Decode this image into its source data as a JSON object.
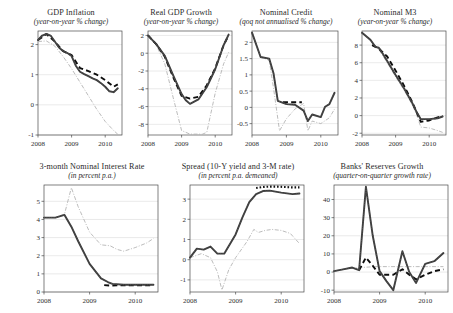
{
  "figure": {
    "background": "#ffffff",
    "series_styles": {
      "actual": "#3b3b3b",
      "forecast_dashed": "#0d0d0d",
      "counterfactual_light": "#b0b0b0",
      "dotted": "#111111"
    }
  },
  "chart_data": [
    {
      "type": "line",
      "id": "gdp-inflation",
      "title": "GDP Inflation",
      "subtitle": "(year-on-year % change)",
      "xlabel": "",
      "ylabel": "",
      "xlim": [
        2008.0,
        2010.5
      ],
      "ylim": [
        -1,
        2.45
      ],
      "xticks": [
        2008,
        2009,
        2010
      ],
      "xticklabels": [
        "2008",
        "2009",
        "2010"
      ],
      "yticks": [
        -1,
        0,
        1,
        2
      ],
      "yticklabels": [
        "-1",
        "0",
        "1",
        "2"
      ],
      "grid": true,
      "legend": "none",
      "series": [
        {
          "name": "actual",
          "style": "solid-thick-grey",
          "x": [
            2008.0,
            2008.125,
            2008.25,
            2008.375,
            2008.5,
            2008.625,
            2008.75,
            2008.875,
            2009.0,
            2009.125,
            2009.25,
            2009.375,
            2009.5,
            2009.625,
            2009.75,
            2009.875,
            2010.0,
            2010.125,
            2010.25,
            2010.375
          ],
          "values": [
            2.15,
            2.3,
            2.35,
            2.3,
            2.1,
            1.9,
            1.78,
            1.72,
            1.62,
            1.3,
            1.1,
            1.02,
            0.95,
            0.88,
            0.82,
            0.72,
            0.6,
            0.45,
            0.42,
            0.55
          ]
        },
        {
          "name": "forecast_dashed",
          "style": "dashed-thick-black",
          "x": [
            2008.0,
            2008.25,
            2008.5,
            2008.75,
            2009.0,
            2009.25,
            2009.5,
            2009.75,
            2010.0,
            2010.25,
            2010.375
          ],
          "values": [
            2.15,
            2.35,
            2.1,
            1.78,
            1.65,
            1.22,
            1.12,
            1.0,
            0.82,
            0.6,
            0.68
          ]
        },
        {
          "name": "counterfactual",
          "style": "light-dashdot",
          "x": [
            2008.0,
            2008.25,
            2008.5,
            2008.75,
            2009.0,
            2009.25,
            2009.5,
            2009.75,
            2010.0,
            2010.25,
            2010.4
          ],
          "values": [
            2.1,
            2.12,
            1.95,
            1.6,
            1.2,
            0.75,
            0.3,
            -0.15,
            -0.55,
            -0.85,
            -1.0
          ]
        }
      ]
    },
    {
      "type": "line",
      "id": "real-gdp-growth",
      "title": "Real GDP Growth",
      "subtitle": "(year-on-year % change)",
      "xlim": [
        2008.0,
        2010.5
      ],
      "ylim": [
        -9.2,
        2.5
      ],
      "xticks": [
        2008,
        2009,
        2010
      ],
      "xticklabels": [
        "2008",
        "2009",
        "2010"
      ],
      "yticks": [
        -8,
        -6,
        -4,
        -2,
        0,
        2
      ],
      "yticklabels": [
        "-8",
        "-6",
        "-4",
        "-2",
        "0",
        "2"
      ],
      "grid": true,
      "series": [
        {
          "name": "actual",
          "style": "solid-thick-grey",
          "x": [
            2008.0,
            2008.25,
            2008.5,
            2008.75,
            2009.0,
            2009.125,
            2009.25,
            2009.5,
            2009.75,
            2010.0,
            2010.25,
            2010.4
          ],
          "values": [
            2.0,
            1.0,
            -0.3,
            -2.5,
            -4.6,
            -5.3,
            -5.7,
            -5.2,
            -3.8,
            -1.8,
            0.9,
            2.1
          ]
        },
        {
          "name": "forecast_dashed",
          "style": "dashed-thick-black",
          "x": [
            2008.0,
            2008.25,
            2008.5,
            2008.75,
            2009.0,
            2009.25,
            2009.5,
            2009.75,
            2010.0,
            2010.25,
            2010.4
          ],
          "values": [
            2.0,
            1.0,
            -0.4,
            -2.7,
            -4.8,
            -5.1,
            -4.9,
            -3.6,
            -1.7,
            0.9,
            2.0
          ]
        },
        {
          "name": "counterfactual",
          "style": "light-dashdot",
          "x": [
            2008.0,
            2008.25,
            2008.5,
            2008.75,
            2009.0,
            2009.25,
            2009.5,
            2009.625,
            2009.75,
            2010.0,
            2010.25,
            2010.4
          ],
          "values": [
            2.0,
            0.9,
            -1.2,
            -5.0,
            -8.7,
            -9.1,
            -9.1,
            -9.1,
            -8.9,
            -4.5,
            -1.2,
            0.1
          ]
        }
      ]
    },
    {
      "type": "line",
      "id": "nominal-credit",
      "title": "Nominal Credit",
      "subtitle": "(qoq not annualised % change)",
      "xlim": [
        2008.0,
        2010.5
      ],
      "ylim": [
        -0.85,
        2.35
      ],
      "xticks": [
        2008,
        2009,
        2010
      ],
      "xticklabels": [
        "2008",
        "2009",
        "2010"
      ],
      "yticks": [
        -0.5,
        0,
        0.5,
        1,
        1.5,
        2
      ],
      "yticklabels": [
        "-0.5",
        "0",
        "0.5",
        "1",
        "1.5",
        "2"
      ],
      "grid": true,
      "series": [
        {
          "name": "actual",
          "style": "solid-thick-grey",
          "x": [
            2008.0,
            2008.25,
            2008.5,
            2008.625,
            2008.75,
            2009.0,
            2009.25,
            2009.5,
            2009.625,
            2009.75,
            2010.0,
            2010.125,
            2010.25,
            2010.4
          ],
          "values": [
            2.3,
            1.55,
            1.5,
            1.05,
            0.2,
            0.1,
            0.08,
            -0.1,
            -0.42,
            -0.22,
            -0.3,
            0.02,
            0.1,
            0.45
          ]
        },
        {
          "name": "forecast_dashed",
          "style": "dashed-thick-black",
          "x": [
            2008.9,
            2009.1,
            2009.3,
            2009.45
          ],
          "values": [
            0.16,
            0.16,
            0.16,
            0.16
          ]
        },
        {
          "name": "counterfactual",
          "style": "light-dashdot",
          "x": [
            2008.0,
            2008.25,
            2008.5,
            2008.625,
            2008.8,
            2009.0,
            2009.25,
            2009.5,
            2009.625,
            2009.75,
            2010.0,
            2010.25,
            2010.4
          ],
          "values": [
            2.3,
            1.55,
            1.45,
            0.6,
            -0.72,
            -0.35,
            -0.05,
            0.12,
            -0.72,
            -0.42,
            -0.5,
            -0.32,
            -0.05
          ]
        }
      ]
    },
    {
      "type": "line",
      "id": "nominal-m3",
      "title": "Nominal M3",
      "subtitle": "(year-on-year % change)",
      "xlim": [
        2008.0,
        2010.5
      ],
      "ylim": [
        -2.2,
        9.6
      ],
      "xticks": [
        2008,
        2009,
        2010
      ],
      "xticklabels": [
        "2008",
        "2009",
        "2010"
      ],
      "yticks": [
        -2,
        0,
        2,
        4,
        6,
        8
      ],
      "yticklabels": [
        "-2",
        "0",
        "2",
        "4",
        "6",
        "8"
      ],
      "grid": true,
      "series": [
        {
          "name": "actual",
          "style": "solid-thick-grey",
          "x": [
            2008.0,
            2008.25,
            2008.4,
            2008.5,
            2008.625,
            2008.75,
            2009.0,
            2009.25,
            2009.5,
            2009.625,
            2009.75,
            2010.0,
            2010.25,
            2010.4
          ],
          "values": [
            9.4,
            8.6,
            7.8,
            7.7,
            7.0,
            6.2,
            4.6,
            3.1,
            1.4,
            0.4,
            -0.4,
            -0.4,
            -0.3,
            -0.1
          ]
        },
        {
          "name": "forecast_dashed",
          "style": "dashed-thick-black",
          "x": [
            2008.3,
            2008.5,
            2008.75,
            2009.0,
            2009.25,
            2009.5,
            2009.625,
            2009.75,
            2010.0,
            2010.25,
            2010.4
          ],
          "values": [
            8.0,
            7.6,
            6.7,
            5.1,
            3.4,
            1.5,
            0.4,
            -0.7,
            -0.55,
            -0.2,
            -0.05
          ]
        },
        {
          "name": "counterfactual",
          "style": "light-dashdot",
          "x": [
            2008.0,
            2008.25,
            2008.5,
            2008.75,
            2009.0,
            2009.25,
            2009.5,
            2009.625,
            2009.75,
            2010.0,
            2010.25,
            2010.4
          ],
          "values": [
            9.4,
            8.5,
            7.5,
            6.0,
            4.4,
            2.9,
            1.2,
            0.1,
            -1.3,
            -1.4,
            -1.7,
            -1.9
          ]
        }
      ]
    },
    {
      "type": "line",
      "id": "interest-rate",
      "title": "3-month Nominal Interest Rate",
      "subtitle": "(in percent p.a.)",
      "xlim": [
        2008.0,
        2010.5
      ],
      "ylim": [
        0,
        5.9
      ],
      "xticks": [
        2008,
        2009,
        2010
      ],
      "xticklabels": [
        "2008",
        "2009",
        "2010"
      ],
      "yticks": [
        0,
        1,
        2,
        3,
        4,
        5
      ],
      "yticklabels": [
        "0",
        "1",
        "2",
        "3",
        "4",
        "5"
      ],
      "grid": true,
      "series": [
        {
          "name": "actual",
          "style": "solid-thick-grey",
          "x": [
            2008.0,
            2008.25,
            2008.45,
            2008.6,
            2008.75,
            2009.0,
            2009.25,
            2009.4,
            2009.5,
            2009.75,
            2010.0,
            2010.25,
            2010.4
          ],
          "values": [
            4.1,
            4.1,
            4.25,
            3.6,
            2.8,
            1.55,
            0.75,
            0.55,
            0.45,
            0.4,
            0.4,
            0.4,
            0.4
          ]
        },
        {
          "name": "forecast_dashed",
          "style": "dashed-thick-black",
          "x": [
            2009.32,
            2009.45,
            2009.6,
            2009.8,
            2010.0,
            2010.2,
            2010.4
          ],
          "values": [
            0.38,
            0.35,
            0.37,
            0.37,
            0.37,
            0.37,
            0.37
          ]
        },
        {
          "name": "counterfactual",
          "style": "light-dashdot",
          "x": [
            2008.0,
            2008.25,
            2008.45,
            2008.6,
            2008.75,
            2009.0,
            2009.25,
            2009.45,
            2009.6,
            2009.75,
            2010.0,
            2010.25,
            2010.4
          ],
          "values": [
            4.1,
            4.1,
            4.3,
            5.75,
            4.7,
            3.3,
            2.6,
            2.55,
            2.35,
            2.25,
            2.45,
            2.7,
            2.95
          ]
        }
      ]
    },
    {
      "type": "line",
      "id": "spread",
      "title": "Spread (10-Y yield and 3-M rate)",
      "subtitle": "(in percent p.a. demeaned)",
      "xlim": [
        2008.0,
        2010.5
      ],
      "ylim": [
        -1.6,
        3.7
      ],
      "xticks": [
        2008,
        2009,
        2010
      ],
      "xticklabels": [
        "2008",
        "2009",
        "2010"
      ],
      "yticks": [
        -1,
        0,
        1,
        2,
        3
      ],
      "yticklabels": [
        "-1",
        "0",
        "1",
        "2",
        "3"
      ],
      "grid": true,
      "series": [
        {
          "name": "actual",
          "style": "solid-thick-grey",
          "x": [
            2008.0,
            2008.15,
            2008.3,
            2008.45,
            2008.6,
            2008.75,
            2009.0,
            2009.15,
            2009.3,
            2009.45,
            2009.6,
            2009.75,
            2010.0,
            2010.25,
            2010.4
          ],
          "values": [
            0.1,
            0.55,
            0.5,
            0.65,
            0.3,
            0.3,
            1.25,
            2.1,
            2.85,
            3.25,
            3.4,
            3.42,
            3.32,
            3.25,
            3.28
          ]
        },
        {
          "name": "dotted",
          "style": "dotted-thick-black",
          "x": [
            2009.45,
            2009.6,
            2009.75,
            2009.9,
            2010.1,
            2010.25,
            2010.4
          ],
          "values": [
            3.55,
            3.6,
            3.62,
            3.62,
            3.6,
            3.58,
            3.58
          ]
        },
        {
          "name": "counterfactual",
          "style": "light-dashdot",
          "x": [
            2008.0,
            2008.25,
            2008.45,
            2008.6,
            2008.7,
            2008.85,
            2009.0,
            2009.25,
            2009.4,
            2009.5,
            2009.65,
            2009.8,
            2010.0,
            2010.2,
            2010.4
          ],
          "values": [
            0.1,
            0.3,
            0.1,
            -0.6,
            -1.5,
            -0.5,
            0.1,
            0.9,
            1.5,
            1.35,
            1.45,
            1.5,
            1.45,
            1.3,
            0.8
          ]
        }
      ]
    },
    {
      "type": "line",
      "id": "bank-reserves",
      "title": "Banks' Reserves Growth",
      "subtitle": "(quarter-on-quarter growth rate)",
      "xlim": [
        2008.0,
        2010.5
      ],
      "ylim": [
        -11,
        48
      ],
      "xticks": [
        2008,
        2009,
        2010
      ],
      "xticklabels": [
        "2008",
        "2009",
        "2010"
      ],
      "yticks": [
        -10,
        0,
        10,
        20,
        30,
        40
      ],
      "yticklabels": [
        "-10",
        "0",
        "10",
        "20",
        "30",
        "40"
      ],
      "grid": true,
      "series": [
        {
          "name": "actual",
          "style": "solid-thick-grey",
          "x": [
            2008.0,
            2008.2,
            2008.4,
            2008.55,
            2008.7,
            2008.85,
            2009.0,
            2009.15,
            2009.3,
            2009.5,
            2009.65,
            2009.8,
            2010.0,
            2010.2,
            2010.4
          ],
          "values": [
            0.5,
            1.5,
            2.5,
            1.0,
            47.0,
            20.0,
            0.5,
            -5.0,
            -10.0,
            11.5,
            0.0,
            -6.0,
            4.5,
            6.0,
            10.5
          ]
        },
        {
          "name": "forecast_dashed",
          "style": "dashed-thick-black",
          "x": [
            2008.55,
            2008.7,
            2008.85,
            2009.0,
            2009.15,
            2009.3,
            2009.5,
            2009.65,
            2009.8,
            2010.0,
            2010.2,
            2010.4
          ],
          "values": [
            1.0,
            8.0,
            3.5,
            -1.5,
            -1.5,
            -1.5,
            1.5,
            -1.5,
            -4.0,
            -1.5,
            0.5,
            1.5
          ]
        },
        {
          "name": "counterfactual",
          "style": "light-dashdot",
          "x": [
            2008.0,
            2008.3,
            2008.6,
            2008.9,
            2009.2,
            2009.5,
            2009.8,
            2010.1,
            2010.4
          ],
          "values": [
            0.5,
            2.0,
            2.5,
            3.0,
            3.0,
            3.0,
            3.0,
            3.0,
            3.0
          ]
        }
      ]
    }
  ],
  "panels": [
    {
      "id": "gdp-inflation",
      "x": 16,
      "y": 8,
      "w": 110,
      "h": 145
    },
    {
      "id": "real-gdp-growth",
      "x": 126,
      "y": 8,
      "w": 110,
      "h": 145
    },
    {
      "id": "nominal-credit",
      "x": 230,
      "y": 8,
      "w": 112,
      "h": 145
    },
    {
      "id": "nominal-m3",
      "x": 340,
      "y": 8,
      "w": 110,
      "h": 145
    },
    {
      "id": "interest-rate",
      "x": 22,
      "y": 162,
      "w": 140,
      "h": 148
    },
    {
      "id": "spread",
      "x": 168,
      "y": 162,
      "w": 140,
      "h": 148
    },
    {
      "id": "bank-reserves",
      "x": 312,
      "y": 162,
      "w": 140,
      "h": 148
    }
  ]
}
